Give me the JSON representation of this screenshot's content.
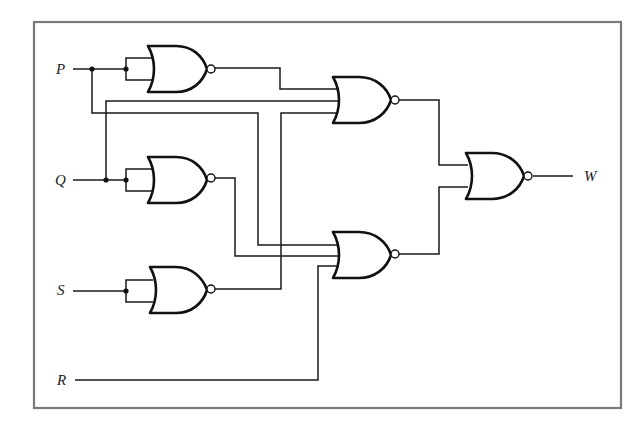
{
  "figure": {
    "type": "logic-circuit",
    "gate_type": "NOR",
    "frame_color": "#7a7a7a",
    "wire_color": "#1a1a1a"
  },
  "inputs": [
    {
      "id": "P",
      "label": "P"
    },
    {
      "id": "Q",
      "label": "Q"
    },
    {
      "id": "S",
      "label": "S"
    },
    {
      "id": "R",
      "label": "R"
    }
  ],
  "outputs": [
    {
      "id": "W",
      "label": "W"
    }
  ],
  "gates": [
    {
      "id": "G1",
      "type": "NOR",
      "inputs": [
        "P",
        "P"
      ]
    },
    {
      "id": "G2",
      "type": "NOR",
      "inputs": [
        "Q",
        "Q"
      ]
    },
    {
      "id": "G3",
      "type": "NOR",
      "inputs": [
        "S",
        "S"
      ]
    },
    {
      "id": "G4",
      "type": "NOR",
      "inputs": [
        "G1",
        "Q",
        "G3"
      ]
    },
    {
      "id": "G5",
      "type": "NOR",
      "inputs": [
        "P",
        "G2",
        "R"
      ]
    },
    {
      "id": "G6",
      "type": "NOR",
      "inputs": [
        "G4",
        "G5"
      ],
      "output": "W"
    }
  ]
}
